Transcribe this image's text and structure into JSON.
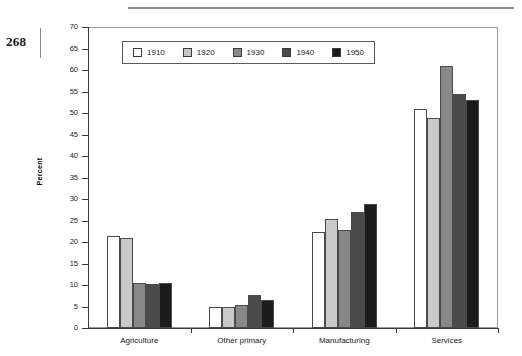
{
  "page": {
    "number": "268"
  },
  "chart_data": {
    "type": "bar",
    "title": "",
    "xlabel": "",
    "ylabel": "Percent",
    "ylim": [
      0,
      70
    ],
    "ytick_step": 5,
    "yticks": [
      0,
      5,
      10,
      15,
      20,
      25,
      30,
      35,
      40,
      45,
      50,
      55,
      60,
      65,
      70
    ],
    "ytick_labels": [
      "0",
      "5",
      "10",
      "15",
      "20",
      "25",
      "30",
      "35",
      "40",
      "45",
      "50",
      "55",
      "60",
      "65",
      "70"
    ],
    "categories": [
      "Agriculture",
      "Other primary",
      "Manufacturing",
      "Services"
    ],
    "grid": false,
    "legend_position": "top-left",
    "series": [
      {
        "name": "1910",
        "color": "#ffffff",
        "values": [
          21.4,
          5.0,
          22.3,
          50.9
        ]
      },
      {
        "name": "1920",
        "color": "#c9c9c9",
        "values": [
          21.0,
          5.0,
          25.4,
          48.8
        ]
      },
      {
        "name": "1930",
        "color": "#888888",
        "values": [
          10.5,
          5.3,
          22.7,
          61.0
        ]
      },
      {
        "name": "1940",
        "color": "#4a4a4a",
        "values": [
          10.3,
          7.6,
          27.0,
          54.4
        ]
      },
      {
        "name": "1950",
        "color": "#1c1c1c",
        "values": [
          10.5,
          6.4,
          28.8,
          53.1
        ]
      }
    ]
  }
}
